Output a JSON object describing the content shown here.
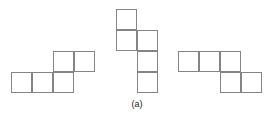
{
  "figure": {
    "caption": "(a)",
    "caption_x": 117,
    "caption_y": 99,
    "caption_width": 40,
    "cell_size": 21,
    "stroke_color": "#858585",
    "background_color": "#ffffff",
    "caption_color": "#1a1a1a",
    "width": 277,
    "height": 120
  },
  "shapes": [
    {
      "name": "left-pentomino",
      "label": "left shape",
      "cell_count": 5,
      "description": "N/S-shaped pentomino: three cells in a bottom row with two cells on the row above, offset right",
      "cells": [
        {
          "x": 11,
          "y": 72
        },
        {
          "x": 32,
          "y": 72
        },
        {
          "x": 53,
          "y": 72
        },
        {
          "x": 53,
          "y": 51
        },
        {
          "x": 74,
          "y": 51
        }
      ]
    },
    {
      "name": "middle-pentomino",
      "label": "middle shape",
      "cell_count": 5,
      "description": "N-shaped vertical pentomino: two cells in the left column stacked, three cells in the right column starting one row down",
      "cells": [
        {
          "x": 116,
          "y": 9
        },
        {
          "x": 116,
          "y": 30
        },
        {
          "x": 137,
          "y": 30
        },
        {
          "x": 137,
          "y": 51
        },
        {
          "x": 137,
          "y": 72
        }
      ]
    },
    {
      "name": "right-pentomino",
      "label": "right shape",
      "cell_count": 5,
      "description": "N/Z-shaped pentomino: three cells in a top row with two cells on the row below, offset right",
      "cells": [
        {
          "x": 178,
          "y": 51
        },
        {
          "x": 199,
          "y": 51
        },
        {
          "x": 220,
          "y": 51
        },
        {
          "x": 220,
          "y": 72
        },
        {
          "x": 241,
          "y": 72
        }
      ]
    }
  ]
}
